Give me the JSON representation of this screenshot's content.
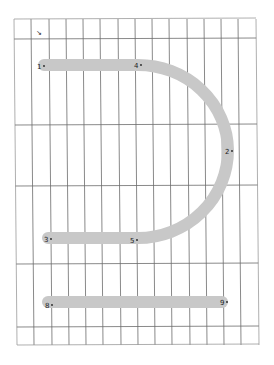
{
  "figure": {
    "type": "stroke-order-glyph-on-grid",
    "colors": {
      "background": "#ffffff",
      "grid_line": "#6b6b6b",
      "grid_line_light": "#9a9a9a",
      "stroke": "#c8c8c8",
      "label": "#222222"
    },
    "grid": {
      "columns_x": [
        14,
        31,
        49,
        66,
        83,
        100,
        118,
        135,
        152,
        169,
        187,
        204,
        221,
        238,
        256
      ],
      "rows_y": [
        19,
        39,
        125,
        186,
        264,
        327,
        345
      ]
    },
    "strokes": [
      {
        "name": "upper-curve",
        "path": "M 44 65 L 138 65 A 90 86 0 0 1 228 150 A 90 88 0 0 1 138 238 L 48 238"
      },
      {
        "name": "bottom-bar",
        "path": "M 48 302 L 222 302"
      }
    ],
    "points": [
      {
        "label": "1",
        "x": 41,
        "y": 66
      },
      {
        "label": "4",
        "x": 138,
        "y": 65
      },
      {
        "label": "2",
        "x": 229,
        "y": 151
      },
      {
        "label": "5",
        "x": 134,
        "y": 240
      },
      {
        "label": "3",
        "x": 48,
        "y": 239
      },
      {
        "label": "8",
        "x": 49,
        "y": 305
      },
      {
        "label": "9",
        "x": 224,
        "y": 302
      }
    ],
    "corner_mark": {
      "glyph": "↘",
      "x": 39,
      "y": 33
    }
  }
}
